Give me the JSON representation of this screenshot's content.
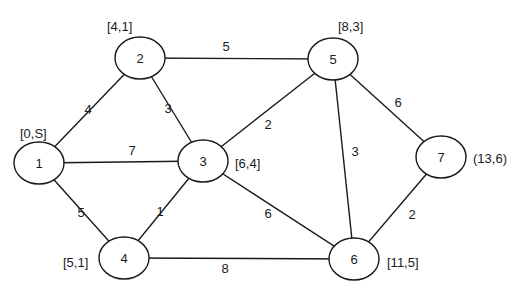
{
  "graph": {
    "nodes": [
      {
        "id": "1",
        "x": 39,
        "y": 163,
        "label": "[0,S]",
        "lx": 20,
        "ly": 133,
        "anchor": "start"
      },
      {
        "id": "2",
        "x": 140,
        "y": 58,
        "label": "[4,1]",
        "lx": 107,
        "ly": 26,
        "anchor": "start"
      },
      {
        "id": "3",
        "x": 203,
        "y": 161,
        "label": "[6,4]",
        "lx": 235,
        "ly": 163,
        "anchor": "start"
      },
      {
        "id": "4",
        "x": 124,
        "y": 258,
        "label": "[5,1]",
        "lx": 63,
        "ly": 262,
        "anchor": "start"
      },
      {
        "id": "5",
        "x": 333,
        "y": 59,
        "label": "[8,3]",
        "lx": 338,
        "ly": 26,
        "anchor": "start"
      },
      {
        "id": "6",
        "x": 354,
        "y": 259,
        "label": "[11,5]",
        "lx": 387,
        "ly": 262,
        "anchor": "start"
      },
      {
        "id": "7",
        "x": 441,
        "y": 157,
        "label": "(13,6)",
        "lx": 473,
        "ly": 158,
        "anchor": "start"
      }
    ],
    "edges": [
      {
        "from": "1",
        "to": "2",
        "weight": "4",
        "wx": 88,
        "wy": 109
      },
      {
        "from": "1",
        "to": "3",
        "weight": "7",
        "wx": 132,
        "wy": 150
      },
      {
        "from": "1",
        "to": "4",
        "weight": "5",
        "wx": 81,
        "wy": 212
      },
      {
        "from": "2",
        "to": "3",
        "weight": "3",
        "wx": 168,
        "wy": 108
      },
      {
        "from": "2",
        "to": "5",
        "weight": "5",
        "wx": 226,
        "wy": 46
      },
      {
        "from": "3",
        "to": "4",
        "weight": "1",
        "wx": 160,
        "wy": 211
      },
      {
        "from": "3",
        "to": "5",
        "weight": "2",
        "wx": 268,
        "wy": 124
      },
      {
        "from": "3",
        "to": "6",
        "weight": "6",
        "wx": 268,
        "wy": 213
      },
      {
        "from": "4",
        "to": "6",
        "weight": "8",
        "wx": 225,
        "wy": 268
      },
      {
        "from": "5",
        "to": "6",
        "weight": "3",
        "wx": 355,
        "wy": 151
      },
      {
        "from": "5",
        "to": "7",
        "weight": "6",
        "wx": 398,
        "wy": 102
      },
      {
        "from": "6",
        "to": "7",
        "weight": "2",
        "wx": 412,
        "wy": 214
      }
    ]
  }
}
